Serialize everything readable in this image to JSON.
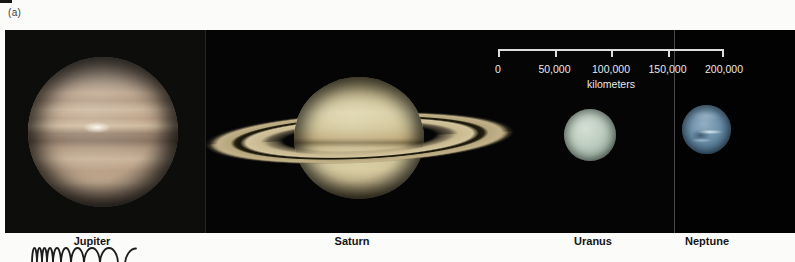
{
  "figure": {
    "panel_label": "(a)"
  },
  "planets": [
    {
      "name": "Jupiter"
    },
    {
      "name": "Saturn"
    },
    {
      "name": "Uranus"
    },
    {
      "name": "Neptune"
    }
  ],
  "scale_bar": {
    "tick_labels": [
      "0",
      "50,000",
      "100,000",
      "150,000",
      "200,000"
    ],
    "unit_label": "kilometers",
    "range_km": [
      0,
      200000
    ]
  },
  "colors": {
    "panel_bg": "#050505",
    "jupiter_base": "#c3ab93",
    "saturn_base": "#d2c79a",
    "uranus_base": "#b9cabd",
    "neptune_base": "#517693",
    "scale_text": "#e9e9e9"
  }
}
